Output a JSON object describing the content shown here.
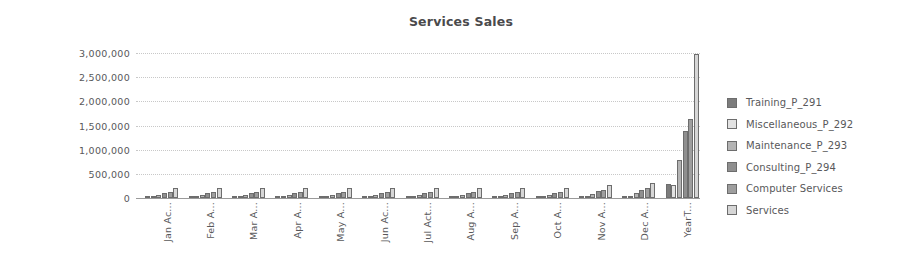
{
  "chart_data": {
    "type": "bar",
    "title": "Services Sales",
    "xlabel": "",
    "ylabel": "",
    "ylim": [
      0,
      3000000
    ],
    "ytick_labels": [
      "3,000,000",
      "2,500,000",
      "2,000,000",
      "1,500,000",
      "1,000,000",
      "500,000",
      "0"
    ],
    "ytick_values": [
      3000000,
      2500000,
      2000000,
      1500000,
      1000000,
      500000,
      0
    ],
    "grid": true,
    "legend_position": "right",
    "categories": [
      "Jan Ac...",
      "Feb A...",
      "Mar A...",
      "Apr A...",
      "May A...",
      "Jun Ac...",
      "Jul Act...",
      "Aug A...",
      "Sep A...",
      "Oct A...",
      "Nov A...",
      "Dec A...",
      "YearT..."
    ],
    "series": [
      {
        "name": "Training_P_291",
        "color": "#7c7c7c",
        "values": [
          22000,
          24000,
          23000,
          22000,
          24000,
          23000,
          22000,
          24000,
          23000,
          22000,
          30000,
          36000,
          295000
        ]
      },
      {
        "name": "Miscellaneous_P_292",
        "color": "#e2e2e2",
        "values": [
          20000,
          21000,
          20000,
          20000,
          21000,
          20000,
          20000,
          21000,
          20000,
          20000,
          26000,
          30000,
          260000
        ]
      },
      {
        "name": "Maintenance_P_293",
        "color": "#b4b4b4",
        "values": [
          60000,
          64000,
          62000,
          60000,
          64000,
          62000,
          60000,
          64000,
          62000,
          60000,
          80000,
          95000,
          790000
        ]
      },
      {
        "name": "Consulting_P_294",
        "color": "#8f8f8f",
        "values": [
          105000,
          110000,
          108000,
          105000,
          110000,
          108000,
          105000,
          110000,
          108000,
          105000,
          140000,
          170000,
          1390000
        ]
      },
      {
        "name": "Computer Services",
        "color": "#9e9e9e",
        "values": [
          125000,
          130000,
          128000,
          125000,
          130000,
          128000,
          125000,
          130000,
          128000,
          125000,
          175000,
          210000,
          1640000
        ]
      },
      {
        "name": "Services",
        "color": "#d6d6d6",
        "values": [
          200000,
          205000,
          203000,
          200000,
          205000,
          203000,
          200000,
          205000,
          203000,
          200000,
          265000,
          320000,
          2980000
        ]
      }
    ]
  }
}
